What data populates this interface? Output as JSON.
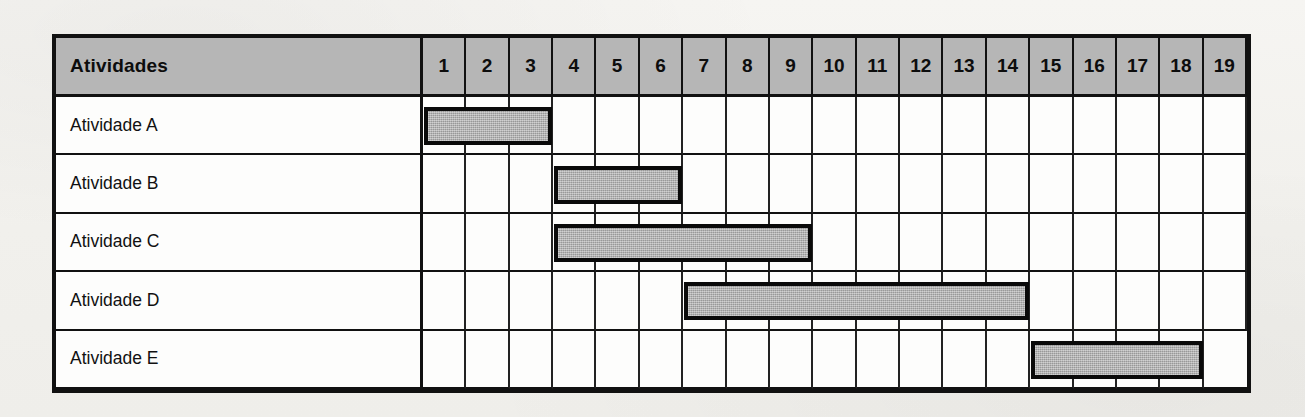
{
  "document": {
    "kind": "gantt-chart",
    "background_color": "#f4f3f0"
  },
  "chart_data": {
    "type": "bar",
    "title": "",
    "xlabel": "",
    "ylabel": "",
    "orientation": "horizontal-gantt",
    "header_label": "Atividades",
    "categories": [
      "Atividade A",
      "Atividade B",
      "Atividade C",
      "Atividade D",
      "Atividade E"
    ],
    "time_units": [
      1,
      2,
      3,
      4,
      5,
      6,
      7,
      8,
      9,
      10,
      11,
      12,
      13,
      14,
      15,
      16,
      17,
      18,
      19
    ],
    "xlim": [
      1,
      19
    ],
    "grid": true,
    "legend": "none",
    "bars": [
      {
        "activity": "Atividade A",
        "start": 1,
        "end": 3,
        "duration": 3
      },
      {
        "activity": "Atividade B",
        "start": 4,
        "end": 6,
        "duration": 3
      },
      {
        "activity": "Atividade C",
        "start": 4,
        "end": 9,
        "duration": 6
      },
      {
        "activity": "Atividade D",
        "start": 7,
        "end": 14,
        "duration": 8
      },
      {
        "activity": "Atividade E",
        "start": 15,
        "end": 18,
        "duration": 4
      }
    ],
    "colors": {
      "bar_fill": "#a9a9a9",
      "bar_border": "#0a0a0a",
      "header_fill": "#b6b6b6",
      "grid_line": "#111111",
      "cell_fill": "#fdfdfc"
    }
  }
}
